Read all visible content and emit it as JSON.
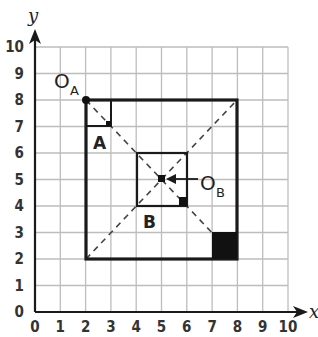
{
  "diagram": {
    "axes": {
      "x_label": "x",
      "y_label": "y",
      "x_ticks": [
        "0",
        "1",
        "2",
        "3",
        "4",
        "5",
        "6",
        "7",
        "8",
        "9",
        "10"
      ],
      "y_ticks": [
        "0",
        "1",
        "2",
        "3",
        "4",
        "5",
        "6",
        "7",
        "8",
        "9",
        "10"
      ],
      "range": [
        0,
        10
      ]
    },
    "shapes": {
      "large_square": {
        "from": [
          2,
          2
        ],
        "to": [
          8,
          8
        ]
      },
      "square_a": {
        "label": "A",
        "from": [
          2,
          7
        ],
        "to": [
          3,
          8
        ]
      },
      "square_b": {
        "label": "B",
        "from": [
          4,
          4
        ],
        "to": [
          6,
          6
        ]
      },
      "filled_square": {
        "from": [
          7,
          2
        ],
        "to": [
          8,
          3
        ]
      }
    },
    "points": {
      "o_a": {
        "label": "O",
        "subscript": "A",
        "at": [
          2,
          8
        ]
      },
      "o_b": {
        "label": "O",
        "subscript": "B",
        "at": [
          5,
          5
        ]
      }
    },
    "dashed_lines": [
      {
        "from": [
          2,
          8
        ],
        "to": [
          8,
          2
        ]
      },
      {
        "from": [
          2,
          2
        ],
        "to": [
          8,
          8
        ]
      }
    ],
    "colors": {
      "grid": "#b8b8b8",
      "ink": "#1a1a1a"
    }
  }
}
